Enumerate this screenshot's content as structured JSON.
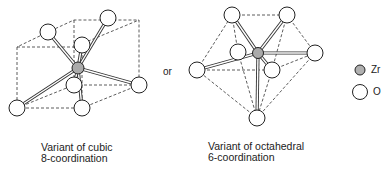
{
  "diagram": {
    "connector_text": "or",
    "left": {
      "caption_line1": "Variant of cubic",
      "caption_line2": "8-coordination"
    },
    "right": {
      "caption_line1": "Variant of octahedral",
      "caption_line2": "6-coordination"
    },
    "legend": [
      {
        "symbol": "grey-filled-circle",
        "label": "Zr",
        "color": "#b0b0b0"
      },
      {
        "symbol": "open-circle",
        "label": "O",
        "color": "#ffffff"
      }
    ]
  }
}
